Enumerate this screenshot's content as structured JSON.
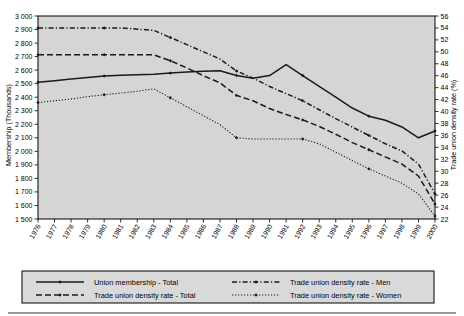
{
  "chart_data": {
    "type": "line",
    "title": "",
    "subtitle": "",
    "xlabel": "",
    "ylabel": "Membership (Thousands)",
    "y2label": "Trade union density rate (%)",
    "grid": false,
    "legend_position": "bottom",
    "x": [
      1976,
      1977,
      1978,
      1979,
      1980,
      1981,
      1982,
      1983,
      1984,
      1985,
      1986,
      1987,
      1988,
      1989,
      1990,
      1991,
      1992,
      1993,
      1994,
      1995,
      1996,
      1997,
      1998,
      1999,
      2000
    ],
    "categories": [
      "1976",
      "1977",
      "1978",
      "1979",
      "1980",
      "1981",
      "1982",
      "1983",
      "1984",
      "1985",
      "1986",
      "1987",
      "1988",
      "1989",
      "1990",
      "1991",
      "1992",
      "1993",
      "1994",
      "1995",
      "1996",
      "1997",
      "1998",
      "1999",
      "2000"
    ],
    "ylim": [
      1500,
      3000
    ],
    "yticks": [
      "1 500",
      "1 600",
      "1 700",
      "1 800",
      "1 900",
      "2 000",
      "2 100",
      "2 200",
      "2 300",
      "2 400",
      "2 500",
      "2 600",
      "2 700",
      "2 800",
      "2 900",
      "3 000"
    ],
    "ytick_values": [
      1500,
      1600,
      1700,
      1800,
      1900,
      2000,
      2100,
      2200,
      2300,
      2400,
      2500,
      2600,
      2700,
      2800,
      2900,
      3000
    ],
    "y2lim": [
      22,
      56
    ],
    "y2ticks": [
      "22",
      "24",
      "26",
      "28",
      "30",
      "32",
      "34",
      "36",
      "38",
      "40",
      "42",
      "44",
      "46",
      "48",
      "50",
      "52",
      "54",
      "56"
    ],
    "y2tick_values": [
      22,
      24,
      26,
      28,
      30,
      32,
      34,
      36,
      38,
      40,
      42,
      44,
      46,
      48,
      50,
      52,
      54,
      56
    ],
    "series": [
      {
        "name": "Union membership - Total",
        "axis": "left",
        "style": "solid",
        "marker": "diamond",
        "values": [
          2510,
          2522,
          2534,
          2546,
          2556,
          2562,
          2566,
          2570,
          2578,
          2586,
          2592,
          2596,
          2560,
          2540,
          2560,
          2640,
          2560,
          2480,
          2400,
          2320,
          2260,
          2230,
          2180,
          2100,
          2150
        ]
      },
      {
        "name": "Trade union density rate - Total",
        "axis": "right",
        "style": "dashed",
        "marker": "diamond",
        "values": [
          49.5,
          49.5,
          49.5,
          49.5,
          49.5,
          49.5,
          49.5,
          49.5,
          48.5,
          47.3,
          46.0,
          44.8,
          42.7,
          41.8,
          40.5,
          39.5,
          38.6,
          37.5,
          36.2,
          34.8,
          33.6,
          32.4,
          31.2,
          29.2,
          24.5
        ]
      },
      {
        "name": "Trade union density rate - Men",
        "axis": "right",
        "style": "dashdot",
        "marker": "diamond",
        "values": [
          54.0,
          54.0,
          54.0,
          54.0,
          54.0,
          54.0,
          53.8,
          53.6,
          52.4,
          51.2,
          50.0,
          48.8,
          46.8,
          45.6,
          44.2,
          43.0,
          41.8,
          40.3,
          38.8,
          37.4,
          36.0,
          34.6,
          33.4,
          31.2,
          26.2
        ]
      },
      {
        "name": "Trade union density rate - Women",
        "axis": "right",
        "style": "dotted",
        "marker": "diamond",
        "values": [
          41.5,
          41.8,
          42.1,
          42.5,
          42.8,
          43.1,
          43.4,
          43.8,
          42.3,
          40.8,
          39.3,
          37.8,
          35.6,
          35.4,
          35.4,
          35.4,
          35.4,
          34.6,
          33.2,
          31.8,
          30.4,
          29.2,
          28.0,
          26.2,
          22.5
        ]
      }
    ]
  },
  "legend": {
    "entries": [
      {
        "label": "Union membership - Total",
        "style": "solid"
      },
      {
        "label": "Trade union density rate - Men",
        "style": "dashdot"
      },
      {
        "label": "Trade union density rate - Total",
        "style": "dashed"
      },
      {
        "label": "Trade union density rate - Women",
        "style": "dotted"
      }
    ]
  }
}
